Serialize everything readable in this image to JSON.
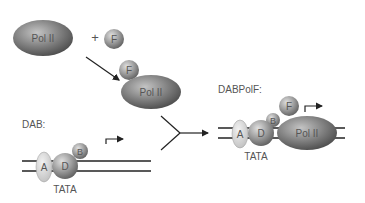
{
  "labels": {
    "pol2": "Pol II",
    "f": "F",
    "plus": "+",
    "a": "A",
    "b": "B",
    "d": "D",
    "tata": "TATA",
    "dab_title": "DAB:",
    "dabpolf_title": "DABPolF:"
  },
  "colors": {
    "pol2_fill": "#7a7a7a",
    "factor_fill": "#9a9a9a",
    "a_fill": "#d8d8d8",
    "line": "#222222",
    "text": "#555555"
  }
}
